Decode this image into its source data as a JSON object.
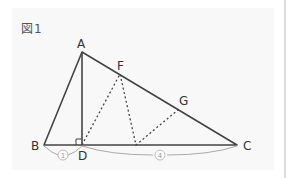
{
  "figure": {
    "label": "図1",
    "vertices": {
      "A": {
        "label": "A",
        "x": 82,
        "y": 52
      },
      "B": {
        "label": "B",
        "x": 44,
        "y": 145
      },
      "C": {
        "label": "C",
        "x": 237,
        "y": 145
      },
      "D": {
        "label": "D",
        "x": 82,
        "y": 145
      },
      "F": {
        "label": "F",
        "x": 120,
        "y": 74
      },
      "G": {
        "label": "G",
        "x": 179,
        "y": 109
      }
    },
    "ratio_labels": {
      "BD": "①",
      "DC": "④"
    },
    "colors": {
      "line": "#444444",
      "label": "#333333",
      "brace": "#aaaaaa",
      "ratio": "#999999"
    }
  }
}
